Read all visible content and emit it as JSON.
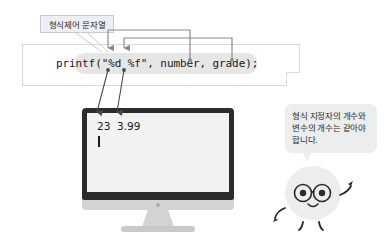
{
  "page": {
    "language": "ko",
    "topic": "printf format specifiers"
  },
  "format_label": {
    "text": "형식제어 문자열"
  },
  "code_panel": {
    "code": "printf(\"%d %f\", number, grade);",
    "tokens": {
      "function": "printf",
      "format_string": "\"%d %f\"",
      "specifier_1": "%d",
      "specifier_2": "%f",
      "argument_1": "number",
      "argument_2": "grade"
    }
  },
  "monitor": {
    "output": "23  3.99",
    "output_values": [
      "23",
      "3.99"
    ],
    "cursor_visible": true
  },
  "speech_bubble": {
    "lines": [
      "형식 지정자의 개수와",
      "변수의 개수는 같아야",
      "합니다."
    ]
  },
  "connectors": {
    "specifier_to_argument": [
      {
        "from": "%d",
        "to": "number"
      },
      {
        "from": "%f",
        "to": "grade"
      }
    ],
    "specifier_to_output": [
      {
        "from": "%d",
        "to": "23"
      },
      {
        "from": "%f",
        "to": "3.99"
      }
    ],
    "label_to_format_string": {
      "from": "형식제어 문자열",
      "to": "\"%d %f\""
    }
  },
  "colors": {
    "label_bg": "#eeeff3",
    "label_border": "#c7cbd6",
    "panel_border": "#d8dade",
    "code_highlight": "#e6e6e6",
    "monitor_bezel": "#2c2c2c",
    "monitor_screen": "#f2f2f2",
    "monitor_chin": "#d2d3d5",
    "bubble_bg": "#eceded",
    "character_body": "#ededed",
    "connector": "#8c8c8c",
    "text": "#1a1a1a"
  }
}
